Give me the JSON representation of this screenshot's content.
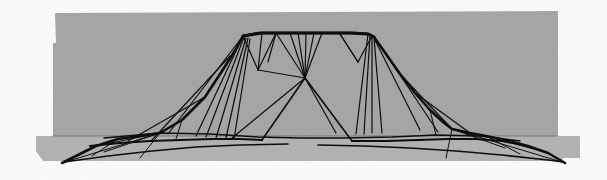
{
  "figure": {
    "render_style": "hidden-line wireframe over shaded ground planes",
    "canvas": {
      "width": 607,
      "height": 180,
      "background_color": "#ffffff"
    }
  },
  "palette": {
    "page_background": "#ffffff",
    "back_panel_fill": "#a9a9a9",
    "ground_plane_fill": "#b6b6b6",
    "wire_color": "#0d0d0d",
    "horizon_line_color": "#6e6e6e"
  },
  "back_panel": {
    "label": "back wall panel",
    "fill": "#a9a9a9",
    "points": "55,13 56,43 53,43 53,136 558,136 558,11"
  },
  "ground_plane": {
    "label": "ground base plane",
    "fill": "#b6b6b6",
    "points": "36,136 558,136 580,136 580,158 563,158 563,161 64,161 43,161 36,151"
  },
  "horizon": {
    "label": "horizon edge where back panel meets ground",
    "x1": 53,
    "y1": 136,
    "x2": 558,
    "y2": 136,
    "color": "#6e6e6e",
    "width": 0.8
  },
  "chart_data": {
    "type": "wireframe-mesh",
    "xlabel": "",
    "ylabel": "",
    "xlim": [
      0,
      607
    ],
    "ylim": [
      0,
      180
    ],
    "grid": false,
    "legend": "none",
    "vertices": {
      "summit_left": [
        243,
        35
      ],
      "summit_right": [
        372,
        35
      ],
      "summit_mid_a": [
        276,
        33
      ],
      "summit_mid_b": [
        310,
        33
      ],
      "summit_mid_c": [
        343,
        34
      ],
      "saddle_center": [
        305,
        78
      ],
      "left_base": [
        160,
        133
      ],
      "right_base": [
        452,
        129
      ],
      "left_spur_tip": [
        62,
        163
      ],
      "right_spur_tip": [
        565,
        163
      ],
      "apron_left": [
        104,
        138
      ],
      "apron_right": [
        505,
        140
      ]
    },
    "silhouette": {
      "name": "outer silhouette ridge",
      "stroke_width": 2.6,
      "points": "62,163 96,146 118,139 140,136 160,133 182,120 205,97 224,68 236,49 243,36 258,33 276,33 296,33 316,33 336,33 356,33 368,34 374,37 386,54 400,74 415,93 430,110 443,122 452,129 470,133 486,136 505,140 528,146 548,153 565,163"
    },
    "ridge_top": {
      "name": "summit plateau edge",
      "stroke_width": 3.0,
      "points": "243,36 262,33 284,33 306,33 328,33 350,33 368,34 374,37"
    },
    "apron_edges": [
      {
        "name": "apron-front-left",
        "stroke_width": 2.2,
        "points": "90,146 120,143 150,141 180,140 212,139 240,139 262,140"
      },
      {
        "name": "apron-front-right",
        "stroke_width": 2.2,
        "points": "352,141 386,141 418,140 448,139 476,139 502,141 524,145"
      },
      {
        "name": "apron-rear-left",
        "stroke_width": 1.6,
        "points": "64,162 108,156 152,151 196,147 240,145 288,144"
      },
      {
        "name": "apron-rear-right",
        "stroke_width": 1.6,
        "points": "318,145 364,146 410,148 456,151 502,155 548,160 563,162"
      },
      {
        "name": "apron-mid-band",
        "stroke_width": 1.4,
        "points": "104,138 160,133 210,134 258,137 300,138 344,138 392,137 436,135 480,136 520,141"
      }
    ],
    "mesh_lines": [
      {
        "name": "left-fan-1",
        "stroke_width": 1.2,
        "points": "243,36 196,136"
      },
      {
        "name": "left-fan-2",
        "stroke_width": 1.2,
        "points": "244,37 206,137"
      },
      {
        "name": "left-fan-3",
        "stroke_width": 1.2,
        "points": "246,38 216,138"
      },
      {
        "name": "left-fan-4",
        "stroke_width": 1.2,
        "points": "248,38 226,138"
      },
      {
        "name": "left-fan-5",
        "stroke_width": 1.2,
        "points": "250,39 234,139"
      },
      {
        "name": "left-rib-a",
        "stroke_width": 1.2,
        "points": "243,36 168,134"
      },
      {
        "name": "left-rib-b",
        "stroke_width": 1.2,
        "points": "230,56 152,140"
      },
      {
        "name": "left-rib-c",
        "stroke_width": 1.2,
        "points": "205,97 128,141"
      },
      {
        "name": "left-rib-d",
        "stroke_width": 1.0,
        "points": "160,133 140,158"
      },
      {
        "name": "left-rib-e",
        "stroke_width": 1.0,
        "points": "160,133 104,152"
      },
      {
        "name": "left-rib-f",
        "stroke_width": 1.0,
        "points": "118,139 92,156"
      },
      {
        "name": "left-rib-g",
        "stroke_width": 1.0,
        "points": "62,163 160,133"
      },
      {
        "name": "left-rib-h",
        "stroke_width": 1.0,
        "points": "182,120 176,139"
      },
      {
        "name": "crest-v1",
        "stroke_width": 1.2,
        "points": "262,33 258,70"
      },
      {
        "name": "crest-v2",
        "stroke_width": 1.2,
        "points": "276,33 268,62"
      },
      {
        "name": "crest-tri-a",
        "stroke_width": 1.2,
        "points": "258,70 276,33"
      },
      {
        "name": "crest-tri-b",
        "stroke_width": 1.2,
        "points": "258,70 243,36"
      },
      {
        "name": "mid-fan-1",
        "stroke_width": 1.2,
        "points": "290,33 305,78"
      },
      {
        "name": "mid-fan-2",
        "stroke_width": 1.2,
        "points": "298,33 305,78"
      },
      {
        "name": "mid-fan-3",
        "stroke_width": 1.2,
        "points": "306,33 305,78"
      },
      {
        "name": "mid-fan-4",
        "stroke_width": 1.2,
        "points": "314,33 305,78"
      },
      {
        "name": "mid-fan-5",
        "stroke_width": 1.2,
        "points": "322,33 305,78"
      },
      {
        "name": "mid-fan-6",
        "stroke_width": 1.2,
        "points": "276,33 305,78"
      },
      {
        "name": "valley-l1",
        "stroke_width": 1.6,
        "points": "305,78 262,140"
      },
      {
        "name": "valley-l2",
        "stroke_width": 1.2,
        "points": "305,78 232,138"
      },
      {
        "name": "valley-r1",
        "stroke_width": 1.6,
        "points": "305,78 352,141"
      },
      {
        "name": "valley-r2",
        "stroke_width": 1.2,
        "points": "305,78 336,133"
      },
      {
        "name": "saddle-rib",
        "stroke_width": 1.2,
        "points": "258,70 305,78"
      },
      {
        "name": "right-ridge",
        "stroke_width": 1.2,
        "points": "340,34 358,62"
      },
      {
        "name": "right-tri-a",
        "stroke_width": 1.2,
        "points": "358,62 372,36"
      },
      {
        "name": "right-tri-b",
        "stroke_width": 1.2,
        "points": "358,62 340,34"
      },
      {
        "name": "right-fan-1",
        "stroke_width": 1.2,
        "points": "368,34 356,134"
      },
      {
        "name": "right-fan-2",
        "stroke_width": 1.2,
        "points": "370,35 364,134"
      },
      {
        "name": "right-fan-3",
        "stroke_width": 1.2,
        "points": "372,36 372,133"
      },
      {
        "name": "right-fan-4",
        "stroke_width": 1.2,
        "points": "374,38 382,133"
      },
      {
        "name": "right-rib-a",
        "stroke_width": 1.2,
        "points": "374,38 420,130"
      },
      {
        "name": "right-rib-b",
        "stroke_width": 1.2,
        "points": "386,54 438,132"
      },
      {
        "name": "right-rib-c",
        "stroke_width": 1.2,
        "points": "400,74 452,129"
      },
      {
        "name": "right-rib-d",
        "stroke_width": 1.2,
        "points": "415,93 470,133"
      },
      {
        "name": "right-rib-e",
        "stroke_width": 1.0,
        "points": "452,129 446,158"
      },
      {
        "name": "right-rib-f",
        "stroke_width": 1.0,
        "points": "452,129 505,148"
      },
      {
        "name": "right-rib-g",
        "stroke_width": 1.0,
        "points": "486,136 520,154"
      },
      {
        "name": "right-rib-h",
        "stroke_width": 1.0,
        "points": "565,163 452,129"
      },
      {
        "name": "right-rib-i",
        "stroke_width": 1.0,
        "points": "430,110 436,135"
      },
      {
        "name": "base-brace-l",
        "stroke_width": 1.0,
        "points": "96,146 160,133"
      },
      {
        "name": "base-brace-r",
        "stroke_width": 1.0,
        "points": "548,153 486,136"
      }
    ]
  }
}
